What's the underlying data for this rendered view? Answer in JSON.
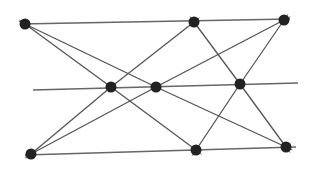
{
  "diagram": {
    "type": "point-line configuration",
    "nodes": [
      {
        "id": "A",
        "x": 25,
        "y": 24
      },
      {
        "id": "B",
        "x": 194,
        "y": 22
      },
      {
        "id": "C",
        "x": 284,
        "y": 20
      },
      {
        "id": "D",
        "x": 111,
        "y": 87
      },
      {
        "id": "E",
        "x": 156,
        "y": 87
      },
      {
        "id": "F",
        "x": 240,
        "y": 84
      },
      {
        "id": "G",
        "x": 31,
        "y": 154
      },
      {
        "id": "H",
        "x": 196,
        "y": 150
      },
      {
        "id": "I",
        "x": 286,
        "y": 147
      }
    ],
    "horizontal_lines": [
      {
        "id": "top",
        "x1": 20,
        "y1": 24,
        "x2": 290,
        "y2": 19
      },
      {
        "id": "middle",
        "x1": 33,
        "y1": 90,
        "x2": 298,
        "y2": 83
      },
      {
        "id": "bottom",
        "x1": 25,
        "y1": 155,
        "x2": 296,
        "y2": 147
      }
    ],
    "edges": [
      [
        "A",
        "D"
      ],
      [
        "A",
        "E"
      ],
      [
        "B",
        "D"
      ],
      [
        "B",
        "F"
      ],
      [
        "C",
        "E"
      ],
      [
        "C",
        "F"
      ],
      [
        "G",
        "D"
      ],
      [
        "G",
        "E"
      ],
      [
        "D",
        "H"
      ],
      [
        "E",
        "I"
      ],
      [
        "F",
        "H"
      ],
      [
        "F",
        "I"
      ]
    ],
    "colors": {
      "node": "#222222",
      "line": "#555555",
      "background": "#ffffff"
    }
  }
}
